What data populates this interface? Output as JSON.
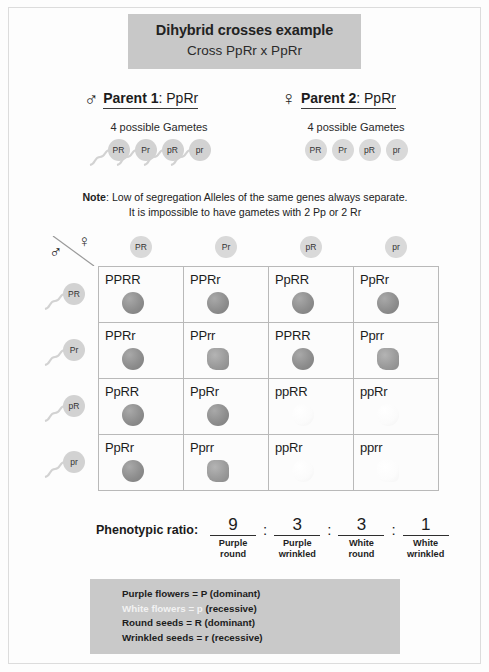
{
  "title": {
    "main": "Dihybrid crosses example",
    "sub": "Cross PpRr x PpRr",
    "banner_color": "#c8c8c8"
  },
  "parents": [
    {
      "symbol": "♂",
      "symbol_name": "male-symbol",
      "label_bold": "Parent 1",
      "label_rest": ": PpRr",
      "gamete_caption": "4 possible Gametes",
      "gamete_type": "sperm",
      "gametes": [
        "PR",
        "Pr",
        "pR",
        "pr"
      ]
    },
    {
      "symbol": "♀",
      "symbol_name": "female-symbol",
      "label_bold": "Parent 2",
      "label_rest": ": PpRr",
      "gamete_caption": "4 possible Gametes",
      "gamete_type": "egg",
      "gametes": [
        "PR",
        "Pr",
        "pR",
        "pr"
      ]
    }
  ],
  "note": {
    "bold": "Note",
    "line1": ": Low of segregation Alleles of the same genes always separate.",
    "line2": "It is impossible to have gametes with 2 Pp or 2 Rr"
  },
  "punnett": {
    "corner": {
      "male_symbol": "♂",
      "female_symbol": "♀"
    },
    "col_headers": [
      "PR",
      "Pr",
      "pR",
      "pr"
    ],
    "row_headers": [
      "PR",
      "Pr",
      "pR",
      "pr"
    ],
    "cells": [
      [
        {
          "genotype": "PPRR",
          "seed": "round",
          "color": "purple"
        },
        {
          "genotype": "PPRr",
          "seed": "round",
          "color": "purple"
        },
        {
          "genotype": "PpRR",
          "seed": "round",
          "color": "purple"
        },
        {
          "genotype": "PpRr",
          "seed": "round",
          "color": "purple"
        }
      ],
      [
        {
          "genotype": "PPRr",
          "seed": "round",
          "color": "purple"
        },
        {
          "genotype": "PPrr",
          "seed": "wrinkled",
          "color": "purple"
        },
        {
          "genotype": "PPRR",
          "seed": "round",
          "color": "purple"
        },
        {
          "genotype": "Pprr",
          "seed": "wrinkled",
          "color": "purple"
        }
      ],
      [
        {
          "genotype": "PpRR",
          "seed": "round",
          "color": "purple"
        },
        {
          "genotype": "PpRr",
          "seed": "round",
          "color": "purple"
        },
        {
          "genotype": "ppRR",
          "seed": "round",
          "color": "white"
        },
        {
          "genotype": "ppRr",
          "seed": "round",
          "color": "white"
        }
      ],
      [
        {
          "genotype": "PpRr",
          "seed": "round",
          "color": "purple"
        },
        {
          "genotype": "Pprr",
          "seed": "wrinkled",
          "color": "purple"
        },
        {
          "genotype": "ppRr",
          "seed": "round",
          "color": "white"
        },
        {
          "genotype": "pprr",
          "seed": "wrinkled",
          "color": "white"
        }
      ]
    ]
  },
  "ratio": {
    "label": "Phenotypic ratio:",
    "terms": [
      {
        "number": "9",
        "line1": "Purple",
        "line2": "round"
      },
      {
        "number": "3",
        "line1": "Purple",
        "line2": "wrinkled"
      },
      {
        "number": "3",
        "line1": "White",
        "line2": "round"
      },
      {
        "number": "1",
        "line1": "White",
        "line2": "wrinkled"
      }
    ],
    "separator": ":"
  },
  "legend": {
    "background_color": "#c9c9c9",
    "lines": [
      {
        "text": "Purple flowers = P (dominant)",
        "hidden": false
      },
      {
        "text": "White flowers = p",
        "tail": "(recessive)",
        "hidden": true
      },
      {
        "text": "Round seeds = R (dominant)",
        "hidden": false
      },
      {
        "text": "Wrinkled seeds = r (recessive)",
        "hidden": false
      }
    ]
  }
}
